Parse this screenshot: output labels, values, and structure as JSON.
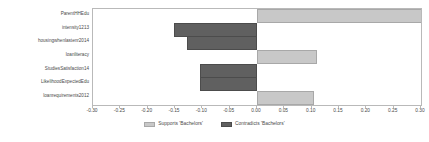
{
  "chart_data": {
    "type": "bar",
    "orientation": "horizontal",
    "title": "",
    "xlabel": "",
    "ylabel": "",
    "xlim": [
      -0.3,
      0.3
    ],
    "xticks": [
      -0.3,
      -0.25,
      -0.2,
      -0.15,
      -0.1,
      -0.05,
      0.0,
      0.05,
      0.1,
      0.15,
      0.2,
      0.25,
      0.3
    ],
    "xtick_labels": [
      "-0.30",
      "-0.25",
      "-0.20",
      "-0.15",
      "-0.10",
      "-0.05",
      "0.00",
      "0.05",
      "0.10",
      "0.15",
      "0.20",
      "0.25",
      "0.30"
    ],
    "grid": false,
    "categories": [
      "ParentHHEdu",
      "intensity1213",
      "housingwhenlastenr2014",
      "loanliteracy",
      "StudiesSatisfaction14",
      "LikelihoodExpectedEdu",
      "loanrequirements2012"
    ],
    "values": [
      0.305,
      -0.152,
      -0.128,
      0.11,
      -0.104,
      -0.104,
      0.105
    ],
    "series": [
      {
        "name": "Supports 'Bachelors'",
        "color": "#c8c8c8",
        "values": [
          0.305,
          null,
          null,
          0.11,
          null,
          null,
          0.105
        ]
      },
      {
        "name": "Contradicts 'Bachelors'",
        "color": "#606060",
        "values": [
          null,
          -0.152,
          -0.128,
          null,
          -0.104,
          -0.104,
          null
        ]
      }
    ],
    "legend": {
      "position": "bottom",
      "entries": [
        {
          "label": "Supports 'Bachelors'",
          "color": "#c8c8c8",
          "swatch": "pos"
        },
        {
          "label": "Contradicts 'Bachelors'",
          "color": "#606060",
          "swatch": "neg"
        }
      ]
    },
    "colors": {
      "positive": "#c8c8c8",
      "negative": "#606060",
      "axis": "#b9b9b9",
      "text": "#4a4a4a",
      "background": "#ffffff"
    }
  }
}
